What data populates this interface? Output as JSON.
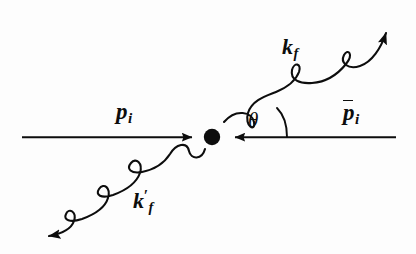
{
  "figure": {
    "background_color": "#fdfdfd",
    "ink_color": "#0d0d0d",
    "width": 416,
    "height": 254
  },
  "labels": {
    "incoming_particle": {
      "base": "p",
      "sub": "i",
      "text": "p_i"
    },
    "incoming_antiparticle": {
      "base": "p",
      "sub": "i",
      "overbar": true,
      "text": "p̄_i"
    },
    "outgoing_photon_upper": {
      "base": "k",
      "sub": "f",
      "text": "k_f"
    },
    "outgoing_photon_lower": {
      "base": "k",
      "prime": "′",
      "sub": "f",
      "text": "k'_f"
    },
    "scattering_angle": {
      "symbol": "θ",
      "text": "θ"
    }
  },
  "elements": {
    "vertex_dot": {
      "cx": 212,
      "cy": 137,
      "r": 8
    },
    "axis_line_left": {
      "x1": 22,
      "y1": 137,
      "x2": 200,
      "y2": 137,
      "arrow": "right"
    },
    "axis_line_right": {
      "x1": 396,
      "y1": 137,
      "x2": 226,
      "y2": 137,
      "arrow": "left"
    },
    "wave_upper_right": {
      "from": [
        224,
        122
      ],
      "to": [
        390,
        22
      ],
      "arrow": "end"
    },
    "wave_lower_left": {
      "from": [
        204,
        148
      ],
      "to": [
        38,
        238
      ],
      "arrow": "end"
    },
    "angle_arc": {
      "center": [
        212,
        137
      ],
      "from_axis": true
    }
  }
}
